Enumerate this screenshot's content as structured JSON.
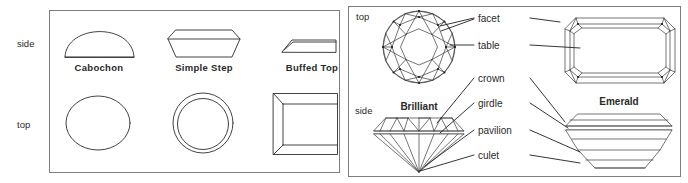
{
  "figure": {
    "background_color": "#ffffff",
    "line_color": "#2e2e2e",
    "frame_color": "#7d7d7d"
  },
  "left_panel": {
    "name": "cabochon-and-step-cuts-panel",
    "view_labels": {
      "side": "side",
      "top": "top"
    },
    "cuts": [
      {
        "caption": "Cabochon",
        "side_shape": "dome",
        "top_shape": "oval"
      },
      {
        "caption": "Simple Step",
        "side_shape": "flat-trapezoid",
        "top_shape": "double-circle"
      },
      {
        "caption": "Buffed Top",
        "side_shape": "shallow-wedge",
        "top_shape": "beveled-rectangle"
      }
    ]
  },
  "right_panel": {
    "name": "faceted-cuts-panel",
    "view_labels": {
      "top": "top",
      "side": "side"
    },
    "cuts": [
      {
        "caption": "Brilliant",
        "top_shape": "round-brilliant-facets",
        "side_shape": "brilliant-profile"
      },
      {
        "caption": "Emerald",
        "top_shape": "emerald-step-facets",
        "side_shape": "emerald-profile"
      }
    ],
    "part_labels": [
      {
        "text": "facet",
        "order": 1
      },
      {
        "text": "table",
        "order": 2
      },
      {
        "text": "crown",
        "order": 3
      },
      {
        "text": "girdle",
        "order": 4
      },
      {
        "text": "pavilion",
        "order": 5
      },
      {
        "text": "culet",
        "order": 6
      }
    ]
  }
}
